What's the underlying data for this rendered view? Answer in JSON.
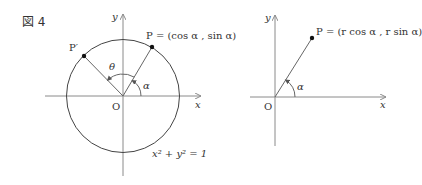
{
  "figure": {
    "caption": "図 4"
  },
  "left_diagram": {
    "axis_x": "x",
    "axis_y": "y",
    "origin": "O",
    "point_p": "P = (cos α , sin α)",
    "point_p_prime": "P′",
    "angle_theta": "θ",
    "angle_alpha": "α",
    "circle_equation": "x² + y² = 1"
  },
  "right_diagram": {
    "axis_x": "x",
    "axis_y": "y",
    "origin": "O",
    "point_p": "P = (r cos α , r sin α)",
    "angle_alpha": "α"
  },
  "colors": {
    "axis": "#8a8a8a",
    "curve": "#444444",
    "text": "#333333"
  }
}
